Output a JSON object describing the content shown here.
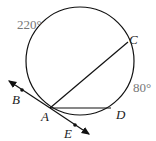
{
  "diagram": {
    "labels": {
      "arc_top": "220°",
      "arc_right": "80°",
      "A": "A",
      "B": "B",
      "C": "C",
      "D": "D",
      "E": "E"
    },
    "colors": {
      "stroke": "#111111",
      "degree_text": "#777777"
    }
  }
}
